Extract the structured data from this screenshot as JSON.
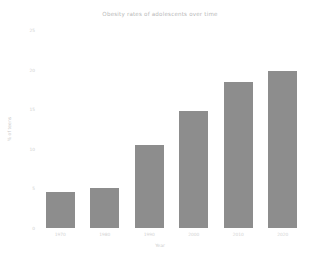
{
  "chart_data": {
    "type": "bar",
    "title": "Obesity rates of adolescents over time",
    "xlabel": "Year",
    "ylabel": "% of teens",
    "categories": [
      "1970",
      "1980",
      "1990",
      "2000",
      "2010",
      "2020"
    ],
    "values": [
      4.5,
      5.0,
      10.5,
      14.8,
      18.4,
      19.8
    ],
    "ylim": [
      0,
      25
    ],
    "yticks": [
      0,
      5,
      10,
      15,
      20,
      25
    ],
    "ytick_labels": [
      "0",
      "5",
      "10",
      "15",
      "20",
      "25"
    ],
    "grid": false,
    "legend": "none",
    "bar_color": "#8d8d8d",
    "background_color": "#ffffff",
    "text_color": "#c9c9c9"
  }
}
